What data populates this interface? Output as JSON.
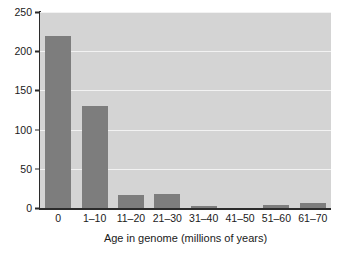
{
  "chart_data": {
    "type": "bar",
    "title": "",
    "xlabel": "Age in genome (millions of years)",
    "ylabel": "Acquired DNA (kb)",
    "categories": [
      "0",
      "1–10",
      "11–20",
      "21–30",
      "31–40",
      "41–50",
      "51–60",
      "61–70"
    ],
    "values": [
      220,
      130,
      16,
      18,
      2,
      0,
      4,
      6
    ],
    "yticks": [
      0,
      50,
      100,
      150,
      200,
      250
    ],
    "ytick_labels": [
      "0",
      "50",
      "100",
      "150",
      "200",
      "250"
    ],
    "ylim": [
      0,
      250
    ],
    "grid": "horizontal",
    "legend": "none",
    "colors": {
      "bar": "#7d7d7d",
      "panel": "#d4d4d4",
      "gridline": "#f2f2f2",
      "axis": "#2b2b2b",
      "text": "#1a1a1a",
      "background": "#ffffff"
    }
  }
}
